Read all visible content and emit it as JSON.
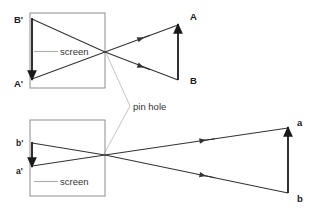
{
  "figure": {
    "background_color": "#ffffff",
    "line_color": "#333333",
    "leader_color": "#a8a8a8",
    "text_color": "#1a1a1a"
  },
  "annotations": {
    "pin_hole_label": "pin hole",
    "screen_label_top": "screen",
    "screen_label_bottom": "screen"
  },
  "top_diagram": {
    "name": "near-object-diagram",
    "object_labels": {
      "head": "A",
      "tail": "B"
    },
    "image_labels": {
      "head": "B'",
      "tail": "A'"
    },
    "screen_box": {
      "x": 30,
      "y": 13,
      "width": 75,
      "height": 75
    },
    "pinhole": {
      "x": 105,
      "y": 52
    },
    "object_arrow": {
      "x": 178,
      "y_tail": 80,
      "y_head": 25
    },
    "image_arrow": {
      "x": 32,
      "y_tail": 18,
      "y_head": 80
    }
  },
  "bottom_diagram": {
    "name": "far-object-diagram",
    "object_labels": {
      "head": "a",
      "tail": "b"
    },
    "image_labels": {
      "head": "b'",
      "tail": "a'"
    },
    "screen_box": {
      "x": 30,
      "y": 120,
      "width": 75,
      "height": 76
    },
    "pinhole": {
      "x": 105,
      "y": 155
    },
    "object_arrow": {
      "x": 288,
      "y_tail": 193,
      "y_head": 128
    },
    "image_arrow": {
      "x": 32,
      "y_tail": 143,
      "y_head": 166
    }
  }
}
